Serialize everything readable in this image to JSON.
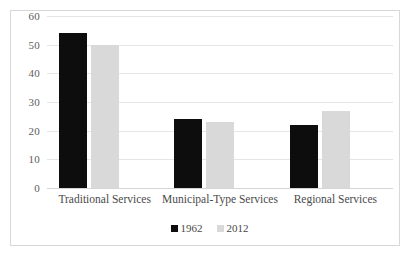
{
  "chart_data": {
    "type": "bar",
    "title": "",
    "subtitle": "",
    "xlabel": "",
    "ylabel": "",
    "categories": [
      "Traditional Services",
      "Municipal-Type Services",
      "Regional Services"
    ],
    "series": [
      {
        "name": "1962",
        "color": "#0d0d0d",
        "values": [
          54,
          24,
          22
        ]
      },
      {
        "name": "2012",
        "color": "#d9d9d9",
        "values": [
          50,
          23,
          27
        ]
      }
    ],
    "ylim": [
      0,
      60
    ],
    "yticks": [
      0,
      10,
      20,
      30,
      40,
      50,
      60
    ],
    "ytick_labels": [
      "0",
      "10",
      "20",
      "30",
      "40",
      "50",
      "60"
    ],
    "grid": true,
    "grid_axis": "y",
    "grid_color": "#e6e6e6",
    "legend": true,
    "legend_position": "bottom",
    "legend_marker": "square",
    "plot_background": "#ffffff",
    "border_color": "#d8d8d8"
  }
}
